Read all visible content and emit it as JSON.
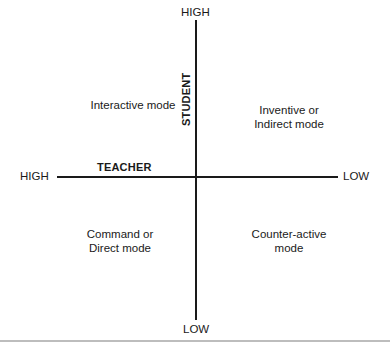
{
  "diagram": {
    "type": "quadrant",
    "vertical_axis": {
      "name": "STUDENT",
      "top_label": "HIGH",
      "bottom_label": "LOW"
    },
    "horizontal_axis": {
      "name": "TEACHER",
      "left_label": "HIGH",
      "right_label": "LOW"
    },
    "quadrants": {
      "top_left": [
        "Interactive mode"
      ],
      "top_right": [
        "Inventive or",
        "Indirect mode"
      ],
      "bottom_left": [
        "Command or",
        "Direct mode"
      ],
      "bottom_right": [
        "Counter-active",
        "mode"
      ]
    },
    "colors": {
      "line": "#1a1a1a",
      "text": "#1a1a1a",
      "rule": "#bdbdbd",
      "background": "#ffffff"
    }
  }
}
